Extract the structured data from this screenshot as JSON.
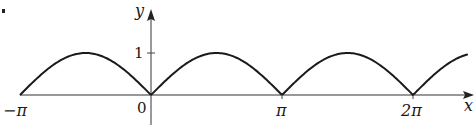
{
  "chart_data": {
    "type": "line",
    "title": "",
    "function_description": "y = |sin x|",
    "xlabel": "x",
    "ylabel": "y",
    "x_ticks": [
      {
        "value": -3.14159,
        "label": "−π"
      },
      {
        "value": 0,
        "label": "0"
      },
      {
        "value": 3.14159,
        "label": "π"
      },
      {
        "value": 6.28319,
        "label": "2π"
      }
    ],
    "y_ticks": [
      {
        "value": 1,
        "label": "1"
      }
    ],
    "xlim": [
      -3.14159,
      8.4
    ],
    "ylim": [
      0,
      1
    ],
    "grid": false,
    "legend": null,
    "series": [
      {
        "name": "|sin x|",
        "x": [
          -3.14159,
          -2.35619,
          -1.5708,
          -0.7854,
          0,
          0.7854,
          1.5708,
          2.35619,
          3.14159,
          3.92699,
          4.71239,
          5.49779,
          6.28319,
          7.06858,
          7.6
        ],
        "values": [
          0,
          0.707,
          1,
          0.707,
          0,
          0.707,
          1,
          0.707,
          0,
          0.707,
          1,
          0.707,
          0,
          0.707,
          0.97
        ]
      }
    ],
    "color": "#1a1a1a"
  },
  "labels": {
    "y_axis": "y",
    "x_axis": "x",
    "tick_one": "1",
    "neg_pi": "−π",
    "zero": "0",
    "pi": "π",
    "two_pi": "2π"
  }
}
